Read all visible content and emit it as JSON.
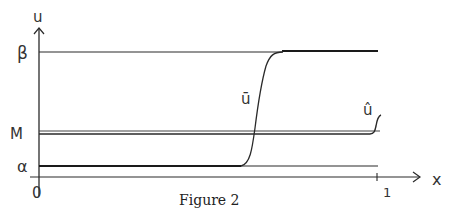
{
  "figure": {
    "caption": "Figure 2",
    "axes": {
      "x_label": "x",
      "y_label": "u",
      "x_ticks": [
        "0",
        "1"
      ],
      "y_ticks": [
        "β",
        "M",
        "α"
      ]
    },
    "curves": {
      "u_bar_label": "ū",
      "u_hat_label": "û"
    },
    "colors": {
      "ink": "#2a2a2a",
      "background": "#ffffff"
    }
  }
}
